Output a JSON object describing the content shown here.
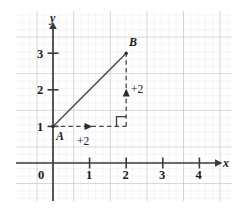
{
  "figure": {
    "type": "coordinate-grid-diagram"
  },
  "axes": {
    "x_label": "x",
    "y_label": "y",
    "origin_label": "0",
    "x_ticks": [
      "1",
      "2",
      "3",
      "4"
    ],
    "y_ticks": [
      "1",
      "2",
      "3"
    ],
    "x_range": [
      -0.4,
      4.5
    ],
    "y_range": [
      -0.6,
      3.7
    ],
    "axis_color": "#3a3a3a"
  },
  "grid": {
    "major_color": "#b9bcc4",
    "minor_color": "#dfe2e8",
    "minor_per_major": 5,
    "show": true
  },
  "points": [
    {
      "name": "A",
      "x": 0,
      "y": 1,
      "label": "A"
    },
    {
      "name": "B",
      "x": 2,
      "y": 3,
      "label": "B"
    }
  ],
  "segments": {
    "hypotenuse": {
      "from": "A",
      "to": "B",
      "style": "solid",
      "color": "#4a4a4a"
    },
    "horizontal_leg": {
      "from": [
        0,
        1
      ],
      "to": [
        2,
        1
      ],
      "style": "dashed",
      "color": "#4a4a4a"
    },
    "vertical_leg": {
      "from": [
        2,
        1
      ],
      "to": [
        2,
        3
      ],
      "style": "dashed",
      "color": "#4a4a4a"
    }
  },
  "annotations": {
    "horizontal_shift": "+2",
    "vertical_shift": "+2",
    "right_angle_marker": true
  },
  "colors": {
    "ink": "#1b1b1b",
    "line": "#4a4a4a",
    "background": "#ffffff"
  }
}
